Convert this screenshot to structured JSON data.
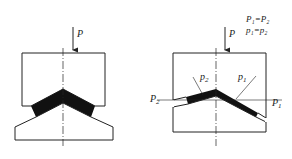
{
  "figures": {
    "left": {
      "force_label": "P"
    },
    "right": {
      "force_label": "P",
      "equation_1": "P₁=P₂",
      "equation_2": "p₁=p₂",
      "label_P2": "P",
      "label_P2_sub": "2",
      "label_P1": "P",
      "label_P1_sub": "1",
      "label_p2": "p",
      "label_p2_sub": "2",
      "label_p1": "p",
      "label_p1_sub": "1"
    }
  },
  "colors": {
    "line": "#222222",
    "fill": "#111111",
    "background": "#ffffff"
  }
}
